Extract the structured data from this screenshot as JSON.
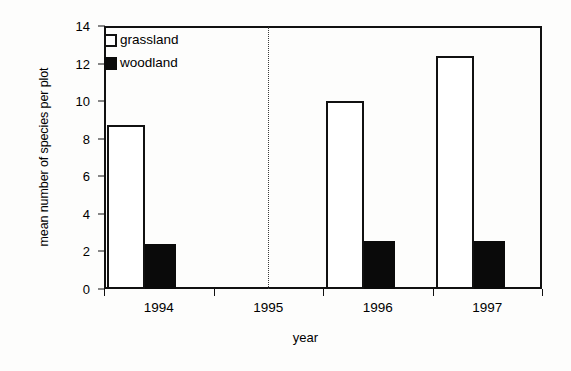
{
  "chart_data": {
    "type": "bar",
    "title": "",
    "xlabel": "year",
    "ylabel": "mean number of species per plot",
    "categories": [
      "1994",
      "1995",
      "1996",
      "1997"
    ],
    "series": [
      {
        "name": "grassland",
        "values": [
          8.75,
          null,
          10.0,
          12.4
        ],
        "style": "open-outline"
      },
      {
        "name": "woodland",
        "values": [
          2.4,
          null,
          2.55,
          2.55
        ],
        "style": "solid-black"
      }
    ],
    "ylim": [
      0,
      14
    ],
    "yticks": [
      0,
      2,
      4,
      6,
      8,
      10,
      12,
      14
    ],
    "ytick_labels": [
      "0",
      "2",
      "4",
      "6",
      "8",
      "10",
      "12",
      "14"
    ],
    "grid": false,
    "legend_position": "top-left",
    "annotations": [
      {
        "kind": "vertical-dotted-line",
        "at_category": "1995",
        "note": "dotted divider in the 1995 slot (no data bars)"
      }
    ],
    "colors": {
      "axis": "#111111",
      "grassland_fill": "#ffffff",
      "grassland_edge": "#111111",
      "woodland_fill": "#0a0a0a",
      "background": "#fdfdfc",
      "separator": "#3a3a3a"
    }
  },
  "legend": {
    "items": [
      {
        "label": "grassland",
        "swatch": "open-square"
      },
      {
        "label": "woodland",
        "swatch": "filled-square"
      }
    ]
  },
  "axes": {
    "y_title": "mean number of species per plot",
    "x_title": "year"
  }
}
